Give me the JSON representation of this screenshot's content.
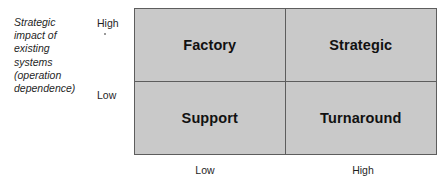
{
  "diagram": {
    "type": "two-by-two-matrix",
    "y_axis": {
      "caption": "Strategic\nimpact of\nexisting\nsystems\n(operation\ndependence)",
      "high_label": "High",
      "low_label": "Low"
    },
    "x_axis": {
      "low_label": "Low",
      "high_label": "High"
    },
    "quadrants": {
      "top_left": "Factory",
      "top_right": "Strategic",
      "bottom_left": "Support",
      "bottom_right": "Turnaround"
    },
    "colors": {
      "cell_fill": "#c9c9c9",
      "border": "#5d5d5d",
      "text": "#111111",
      "background": "#ffffff"
    }
  }
}
